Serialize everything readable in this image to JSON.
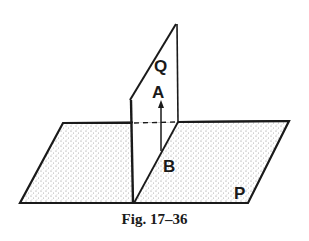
{
  "figure": {
    "caption": "Fig. 17–36",
    "labels": {
      "plane_q": "Q",
      "point_a": "A",
      "point_b": "B",
      "plane_p": "P"
    },
    "colors": {
      "line": "#1a1a1a",
      "stipple": "#8a8a8a",
      "background": "#ffffff"
    }
  }
}
